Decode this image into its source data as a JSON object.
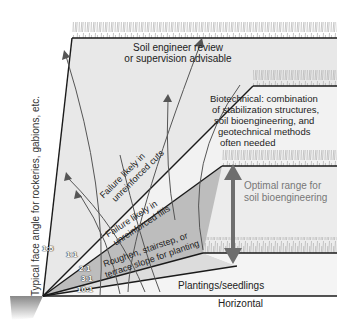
{
  "diagram": {
    "vertical_axis_label": "Typical face angle for rockeries, gabions, etc.",
    "regions": {
      "top": "Soil engineer review or supervision advisable",
      "top_line1": "Soil engineer review",
      "top_line2": "or supervision advisable",
      "biotechnical_lines": [
        "Biotechnical: combination",
        "of stabilization structures,",
        "soil bioengineering, and",
        "geotechnical methods",
        "often needed"
      ],
      "failure_cuts_line1": "Failure likely in",
      "failure_cuts_line2": "unreinforced cuts",
      "failure_fills_line1": "Failure likely in",
      "failure_fills_line2": "unreinforced fills",
      "roughen_line1": "Roughen, stairstep, or",
      "roughen_line2": "terrace slope for planting",
      "plantings": "Plantings/seedlings",
      "horizontal": "Horizontal",
      "optimal_line1": "Optimal range for",
      "optimal_line2": "soil bioengineering"
    },
    "slope_ratios": [
      "1:5",
      "1:1",
      "2:1",
      "3:1",
      "10:1"
    ],
    "colors": {
      "fan_light": "#e6e6e6",
      "fan_mid": "#d2d2d2",
      "optimal_band": "#b9b9b9",
      "arrow": "#6e6e6e",
      "line": "#1a1a1a",
      "grass": "#b5b5b5"
    }
  }
}
